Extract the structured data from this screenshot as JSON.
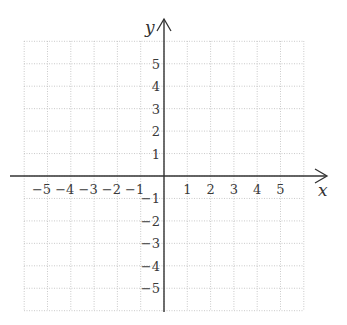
{
  "chart_data": {
    "type": "scatter",
    "title": "",
    "xlabel": "x",
    "ylabel": "y",
    "xlim": [
      -6,
      6
    ],
    "ylim": [
      -6,
      6
    ],
    "grid": true,
    "grid_style": "dotted",
    "x_ticks": [
      -5,
      -4,
      -3,
      -2,
      -1,
      1,
      2,
      3,
      4,
      5
    ],
    "y_ticks": [
      5,
      4,
      3,
      2,
      1,
      -1,
      -2,
      -3,
      -4,
      -5
    ],
    "x_tick_labels": [
      "−5",
      "−4",
      "−3",
      "−2",
      "−1",
      "1",
      "2",
      "3",
      "4",
      "5"
    ],
    "y_tick_labels": [
      "5",
      "4",
      "3",
      "2",
      "1",
      "−1",
      "−2",
      "−3",
      "−4",
      "−5"
    ],
    "series": [],
    "colors": {
      "axis": "#333333",
      "grid": "#bdbdbd",
      "text": "#3a3a3a"
    }
  }
}
